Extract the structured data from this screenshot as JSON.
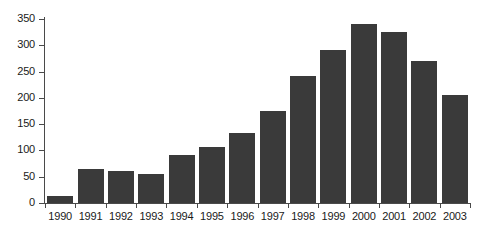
{
  "chart_data": {
    "type": "bar",
    "title": "",
    "subtitle": "",
    "xlabel": "",
    "ylabel": "",
    "categories": [
      "1990",
      "1991",
      "1992",
      "1993",
      "1994",
      "1995",
      "1996",
      "1997",
      "1998",
      "1999",
      "2000",
      "2001",
      "2002",
      "2003"
    ],
    "values": [
      14,
      64,
      60,
      56,
      92,
      107,
      134,
      175,
      241,
      292,
      341,
      326,
      271,
      206
    ],
    "ylim": [
      0,
      350
    ],
    "yticks": [
      0,
      50,
      100,
      150,
      200,
      250,
      300,
      350
    ],
    "ytick_labels": [
      "0",
      "50",
      "100",
      "150",
      "200",
      "250",
      "300",
      "350"
    ],
    "grid": false,
    "legend": null,
    "legend_position": "none",
    "bar_color": "#3a3a3a",
    "axis_color": "#4a4a4a",
    "background_color": "#ffffff",
    "annotations": []
  }
}
